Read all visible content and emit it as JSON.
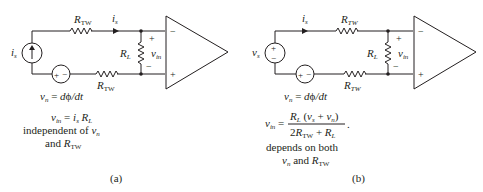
{
  "figure": {
    "panel_a": {
      "label": "(a)",
      "source_symbol": "i",
      "source_sub": "s",
      "current_label": "i",
      "current_sub": "s",
      "r_top": "R",
      "r_top_sub": "TW",
      "r_bot": "R",
      "r_bot_sub": "TW",
      "r_load": "R",
      "r_load_sub": "L",
      "vin": "v",
      "vin_sub": "in",
      "plus": "+",
      "minus": "−",
      "noise_src": "+ −",
      "noise_eq": "v",
      "noise_eq_sub": "n",
      "noise_eq_rhs": " = dϕ/dt",
      "result_line1": "v_in = i_s R_L",
      "result_line2": "independent of v_n",
      "result_line3": "and R_TW"
    },
    "panel_b": {
      "label": "(b)",
      "source_symbol": "v",
      "source_sub": "s",
      "current_label": "i",
      "current_sub": "s",
      "r_top": "R",
      "r_top_sub": "TW",
      "r_bot": "R",
      "r_bot_sub": "TW",
      "r_load": "R",
      "r_load_sub": "L",
      "vin": "v",
      "vin_sub": "in",
      "plus": "+",
      "minus": "−",
      "noise_src": "+ −",
      "noise_eq": "v",
      "noise_eq_sub": "n",
      "noise_eq_rhs": " = dϕ/dt",
      "result_numerator": "R_L (v_s + v_n)",
      "result_denominator": "2R_TW + R_L",
      "result_lhs": "v_in =",
      "result_line2": "depends on both",
      "result_line3": "v_n and R_TW"
    }
  }
}
